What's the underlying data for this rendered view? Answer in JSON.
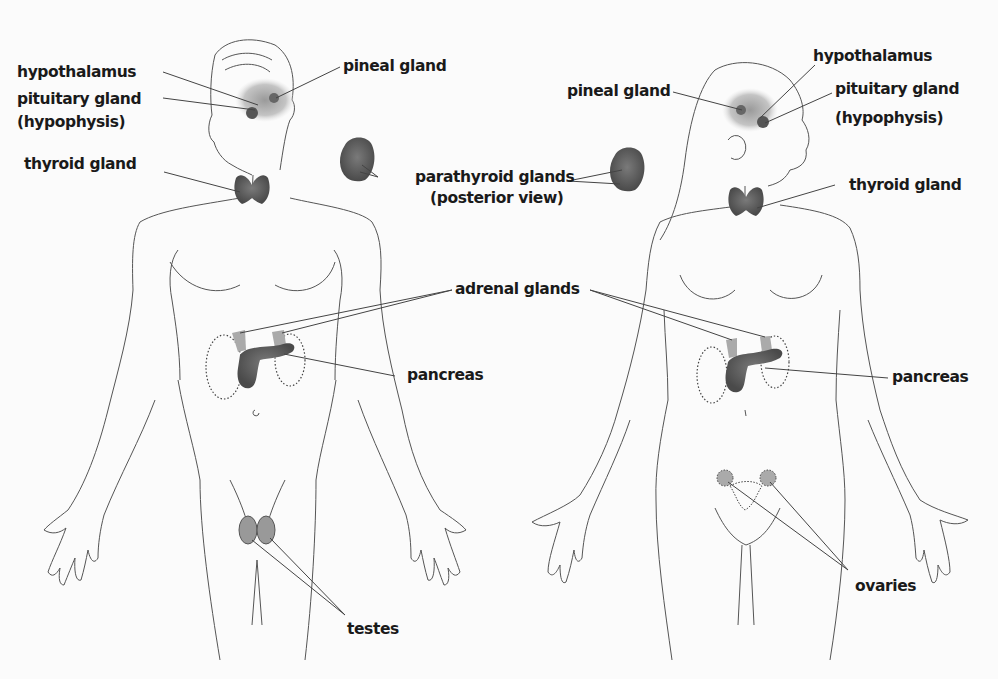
{
  "diagram": {
    "type": "anatomy",
    "colors": {
      "background": "#fbfbfb",
      "outline": "#444444",
      "gland": "#5a5a5a",
      "label": "#1a1a1a"
    }
  },
  "male": {
    "labels": {
      "hypothalamus": "hypothalamus",
      "pituitary": "pituitary gland",
      "pituitary_alt": "(hypophysis)",
      "pineal": "pineal gland",
      "thyroid": "thyroid gland",
      "adrenal": "adrenal glands",
      "pancreas": "pancreas",
      "testes": "testes"
    }
  },
  "parathyroid": {
    "label": "parathyroid glands",
    "sublabel": "(posterior view)"
  },
  "female": {
    "labels": {
      "hypothalamus": "hypothalamus",
      "pineal": "pineal gland",
      "pituitary": "pituitary gland",
      "pituitary_alt": "(hypophysis)",
      "thyroid": "thyroid gland",
      "pancreas": "pancreas",
      "ovaries": "ovaries"
    }
  }
}
